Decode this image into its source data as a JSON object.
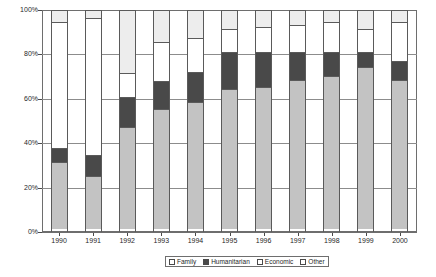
{
  "chart_data": {
    "type": "bar",
    "stacked": true,
    "stacked_normalized": true,
    "title": "",
    "subtitle": "",
    "xlabel": "",
    "ylabel": "",
    "ylim": [
      0,
      100
    ],
    "yticks": [
      0,
      20,
      40,
      60,
      80,
      100
    ],
    "ytick_labels": [
      "0%",
      "20%",
      "40%",
      "60%",
      "80%",
      "100%"
    ],
    "grid": true,
    "legend_position": "bottom",
    "categories": [
      "1990",
      "1991",
      "1992",
      "1993",
      "1994",
      "1995",
      "1996",
      "1997",
      "1998",
      "1999",
      "2000"
    ],
    "series": [
      {
        "name": "Family",
        "color": "#c3c3c3",
        "values": [
          30,
          24,
          46,
          54,
          57,
          63,
          64,
          67,
          69,
          73,
          67
        ]
      },
      {
        "name": "Humanitarian",
        "color": "#494949",
        "values": [
          7,
          10,
          14,
          13,
          14,
          17,
          16,
          13,
          11,
          7,
          9
        ]
      },
      {
        "name": "Economic",
        "color": "#ffffff",
        "values": [
          57,
          62,
          11,
          18,
          16,
          11,
          12,
          13,
          14,
          11,
          18
        ]
      },
      {
        "name": "Other",
        "color": "#ededed",
        "values": [
          6,
          4,
          29,
          15,
          13,
          9,
          8,
          7,
          6,
          9,
          6
        ]
      }
    ],
    "legend_entries": [
      "Family",
      "Humanitarian",
      "Economic",
      "Other"
    ]
  },
  "legend": {
    "items": [
      {
        "label": "Family",
        "swatch": "family-swatch"
      },
      {
        "label": "Humanitarian",
        "swatch": "humanitarian-swatch"
      },
      {
        "label": "Economic",
        "swatch": "economic-swatch"
      },
      {
        "label": "Other",
        "swatch": "other-swatch"
      }
    ]
  }
}
